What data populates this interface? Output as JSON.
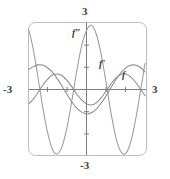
{
  "figure": {
    "frame": {
      "style": "rounded-rectangle-viewport",
      "color": "#b9b9b9"
    }
  },
  "axes": {
    "x_max_label": "3",
    "x_min_label": "-3",
    "y_max_label": "3",
    "y_min_label": "-3",
    "color": "#7a7a7a",
    "tick_marks": "unit ticks on both axes"
  },
  "curve_labels": {
    "f": "f",
    "f_prime": "f'",
    "f_double_prime": "f″"
  },
  "chart_data": {
    "type": "line",
    "title": "",
    "xlabel": "",
    "ylabel": "",
    "xlim": [
      -3,
      3
    ],
    "ylim": [
      -3,
      3
    ],
    "xticks": [
      -3,
      -2,
      -1,
      0,
      1,
      2,
      3
    ],
    "yticks": [
      -3,
      -2,
      -1,
      0,
      1,
      2,
      3
    ],
    "grid": false,
    "legend": "inline curve labels",
    "colors": {
      "f": "#8f8f8f",
      "f_prime": "#8f8f8f",
      "f_double_prime": "#9a9a9a"
    },
    "series": [
      {
        "name": "f",
        "label": "f",
        "expression": "0.7*sin(1.6*x + 0.55)",
        "label_point": [
          1.25,
          0.62
        ],
        "x": [
          -3.0,
          -2.75,
          -2.5,
          -2.25,
          -2.0,
          -1.75,
          -1.5,
          -1.25,
          -1.0,
          -0.75,
          -0.5,
          -0.25,
          0.0,
          0.25,
          0.5,
          0.75,
          1.0,
          1.25,
          1.5,
          1.75,
          2.0,
          2.25,
          2.5,
          2.75,
          3.0
        ],
        "y": [
          -0.68,
          -0.46,
          -0.15,
          0.19,
          0.46,
          0.65,
          0.7,
          0.62,
          0.41,
          0.12,
          -0.2,
          -0.47,
          -0.64,
          -0.7,
          -0.6,
          -0.38,
          -0.08,
          0.25,
          0.51,
          0.67,
          0.7,
          0.58,
          0.35,
          0.04,
          -0.28
        ]
      },
      {
        "name": "f_prime",
        "label": "f'",
        "expression": "1.12*cos(1.6*x + 0.55)",
        "label_point": [
          0.5,
          1.05
        ],
        "x": [
          -3.0,
          -2.75,
          -2.5,
          -2.25,
          -2.0,
          -1.75,
          -1.5,
          -1.25,
          -1.0,
          -0.75,
          -0.5,
          -0.25,
          0.0,
          0.25,
          0.5,
          0.75,
          1.0,
          1.25,
          1.5,
          1.75,
          2.0,
          2.25,
          2.5,
          2.75,
          3.0
        ],
        "y": [
          0.88,
          1.02,
          1.11,
          1.1,
          0.98,
          0.78,
          0.49,
          0.15,
          -0.22,
          -0.56,
          -0.84,
          -1.02,
          -1.1,
          -1.05,
          -0.88,
          -0.62,
          -0.29,
          0.08,
          0.44,
          0.74,
          0.96,
          1.09,
          1.1,
          1.0,
          0.79
        ]
      },
      {
        "name": "f_double_prime",
        "label": "f″",
        "expression": "-2.9*sin(1.6*x + 0.55)",
        "label_point": [
          -0.35,
          2.22
        ],
        "x": [
          -3.0,
          -2.75,
          -2.5,
          -2.25,
          -2.0,
          -1.75,
          -1.5,
          -1.25,
          -1.0,
          -0.75,
          -0.5,
          -0.25,
          0.0,
          0.25,
          0.5,
          0.75,
          1.0,
          1.25,
          1.5,
          1.75,
          2.0,
          2.25,
          2.5,
          2.75,
          3.0
        ],
        "y": [
          2.82,
          1.9,
          0.62,
          -0.77,
          -1.92,
          -2.69,
          -2.9,
          -2.56,
          -1.71,
          -0.51,
          0.83,
          1.96,
          2.66,
          2.89,
          2.5,
          1.59,
          0.33,
          -1.02,
          -2.13,
          -2.78,
          -2.89,
          -2.41,
          -1.45,
          -0.16,
          1.18
        ]
      }
    ]
  }
}
